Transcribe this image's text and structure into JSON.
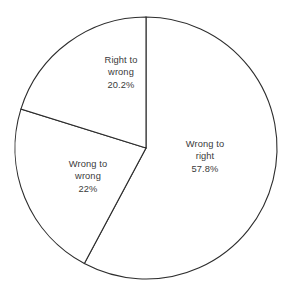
{
  "chart_data": {
    "type": "pie",
    "title": "",
    "subtitle": "",
    "xlabel": "",
    "ylabel": "",
    "legend": "none",
    "grid": false,
    "units": "percent",
    "total": 100,
    "start_angle_deg": 0,
    "direction": "clockwise",
    "categories": [
      "Wrong to right",
      "Wrong to wrong",
      "Right to wrong"
    ],
    "values": [
      57.8,
      22,
      20.2
    ],
    "value_labels": [
      "57.8%",
      "22%",
      "20.2%"
    ],
    "slices": [
      {
        "name": "Wrong to right",
        "value": 57.8,
        "value_label": "57.8%",
        "label_lines": [
          "Wrong to",
          "right"
        ],
        "fill": "#ffffff",
        "stroke": "#2d2d2d",
        "label_x": 205,
        "label_y": 157,
        "start_deg": 0,
        "end_deg": 208.08
      },
      {
        "name": "Wrong to wrong",
        "value": 22,
        "value_label": "22%",
        "label_lines": [
          "Wrong to",
          "wrong"
        ],
        "fill": "#ffffff",
        "stroke": "#2d2d2d",
        "label_x": 88,
        "label_y": 177,
        "start_deg": 208.08,
        "end_deg": 287.28
      },
      {
        "name": "Right to wrong",
        "value": 20.2,
        "value_label": "20.2%",
        "label_lines": [
          "Right to",
          "wrong"
        ],
        "fill": "#ffffff",
        "stroke": "#2d2d2d",
        "label_x": 121,
        "label_y": 73,
        "start_deg": 287.28,
        "end_deg": 360
      }
    ],
    "geometry": {
      "center_x": 146,
      "center_y": 148,
      "radius": 131
    },
    "colors": {
      "background": "#ffffff",
      "outline": "#2d2d2d",
      "text": "#3a3a3a"
    }
  }
}
